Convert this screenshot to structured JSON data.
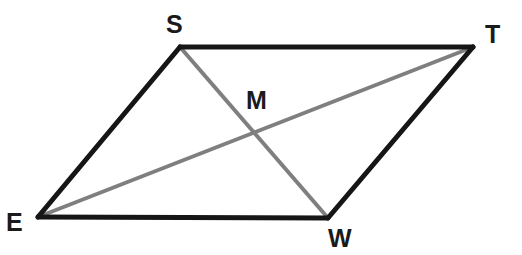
{
  "figure": {
    "name": "parallelogram-with-diagonals",
    "background_color": "#ffffff",
    "width": 522,
    "height": 255,
    "edge_color": "#161616",
    "edge_width": 5,
    "diagonal_color": "#7f7f7f",
    "diagonal_width": 4,
    "label_color": "#1a1a1a",
    "vertices": [
      {
        "id": "S",
        "label": "S",
        "x": 180,
        "y": 47,
        "label_x": 166,
        "label_y": 12
      },
      {
        "id": "T",
        "label": "T",
        "x": 473,
        "y": 47,
        "label_x": 485,
        "label_y": 22
      },
      {
        "id": "W",
        "label": "W",
        "x": 328,
        "y": 218,
        "label_x": 328,
        "label_y": 226
      },
      {
        "id": "E",
        "label": "E",
        "x": 38,
        "y": 217,
        "label_x": 6,
        "label_y": 210
      },
      {
        "id": "M",
        "label": "M",
        "x": 254,
        "y": 137,
        "label_x": 246,
        "label_y": 88
      }
    ],
    "edges": [
      {
        "id": "edge-E-S",
        "from": "E",
        "to": "S",
        "x1": 38,
        "y1": 217,
        "x2": 180,
        "y2": 47,
        "style": "solid-black"
      },
      {
        "id": "edge-S-T",
        "from": "S",
        "to": "T",
        "x1": 180,
        "y1": 47,
        "x2": 473,
        "y2": 47,
        "style": "solid-black"
      },
      {
        "id": "edge-T-W",
        "from": "T",
        "to": "W",
        "x1": 473,
        "y1": 47,
        "x2": 328,
        "y2": 218,
        "style": "solid-black"
      },
      {
        "id": "edge-W-E",
        "from": "W",
        "to": "E",
        "x1": 328,
        "y1": 218,
        "x2": 38,
        "y2": 217,
        "style": "solid-black"
      }
    ],
    "diagonals": [
      {
        "id": "diagonal-S-W",
        "from": "S",
        "to": "W",
        "x1": 180,
        "y1": 47,
        "x2": 328,
        "y2": 218,
        "style": "solid-gray"
      },
      {
        "id": "diagonal-E-T",
        "from": "E",
        "to": "T",
        "x1": 38,
        "y1": 217,
        "x2": 473,
        "y2": 47,
        "style": "solid-gray"
      }
    ]
  }
}
